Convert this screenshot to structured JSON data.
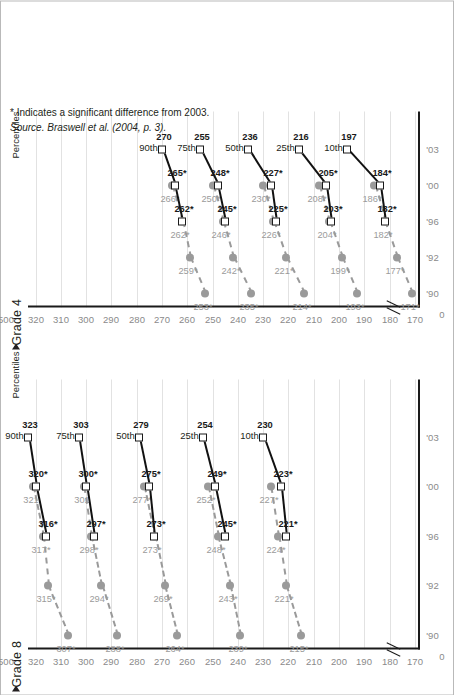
{
  "figure": {
    "percentiles_label": "Percentiles",
    "grade8_title": "Grade 8",
    "grade4_title": "Grade 4",
    "footnote": "* Indicates a significant difference from 2003.",
    "source": "Source. Braswell et al. (2004, p. 3).",
    "legend": [
      {
        "label": "Accommodations not permitted",
        "marker": "gray-circle-dashed"
      },
      {
        "label": "Accommodations permitted",
        "marker": "open-square-solid"
      }
    ],
    "colors": {
      "not_permitted": "#9a9a9a",
      "permitted": "#111111",
      "gridline": "#e2e2e2",
      "axis": "#1a1a1a",
      "tick_text": "#8a8a8a"
    }
  },
  "chart_data": [
    {
      "type": "line",
      "title": "Grade 8",
      "xlabel": "",
      "ylabel": "",
      "x": [
        "'90",
        "'92",
        "'96",
        "'00",
        "'03"
      ],
      "xtick_labels": [
        "'90",
        "'92",
        "'96",
        "'00",
        "'03"
      ],
      "ytick_labels": [
        "500",
        "320",
        "310",
        "300",
        "290",
        "280",
        "270",
        "260",
        "250",
        "240",
        "230",
        "220",
        "210",
        "200",
        "190",
        "180",
        "170",
        "0"
      ],
      "ylim": [
        170,
        325
      ],
      "axis_break": true,
      "grid": true,
      "legend_position": "bottom-right",
      "percentiles": [
        "90th",
        "75th",
        "50th",
        "25th",
        "10th"
      ],
      "series": [
        {
          "name": "Accommodations not permitted",
          "style": "dashed-gray-circle",
          "points": {
            "90th": [
              {
                "x": "'90",
                "y": 307,
                "label": "307*"
              },
              {
                "x": "'92",
                "y": 315,
                "label": "315*"
              },
              {
                "x": "'96",
                "y": 317,
                "label": "317*"
              },
              {
                "x": "'00",
                "y": 321,
                "label": "321"
              }
            ],
            "75th": [
              {
                "x": "'90",
                "y": 288,
                "label": "288*"
              },
              {
                "x": "'92",
                "y": 294,
                "label": "294*"
              },
              {
                "x": "'96",
                "y": 298,
                "label": "298*"
              },
              {
                "x": "'00",
                "y": 301,
                "label": "301"
              }
            ],
            "50th": [
              {
                "x": "'90",
                "y": 264,
                "label": "264*"
              },
              {
                "x": "'92",
                "y": 269,
                "label": "269*"
              },
              {
                "x": "'96",
                "y": 273,
                "label": "273*"
              },
              {
                "x": "'00",
                "y": 277,
                "label": "277*"
              }
            ],
            "25th": [
              {
                "x": "'90",
                "y": 239,
                "label": "239*"
              },
              {
                "x": "'92",
                "y": 243,
                "label": "243*"
              },
              {
                "x": "'96",
                "y": 248,
                "label": "248*"
              },
              {
                "x": "'00",
                "y": 252,
                "label": "252*"
              }
            ],
            "10th": [
              {
                "x": "'90",
                "y": 215,
                "label": "215*"
              },
              {
                "x": "'92",
                "y": 221,
                "label": "221*"
              },
              {
                "x": "'96",
                "y": 224,
                "label": "224*"
              },
              {
                "x": "'00",
                "y": 227,
                "label": "227*"
              }
            ]
          }
        },
        {
          "name": "Accommodations permitted",
          "style": "solid-black-square",
          "points": {
            "90th": [
              {
                "x": "'96",
                "y": 316,
                "label": "316*"
              },
              {
                "x": "'00",
                "y": 320,
                "label": "320*"
              },
              {
                "x": "'03",
                "y": 323,
                "label": "323"
              }
            ],
            "75th": [
              {
                "x": "'96",
                "y": 297,
                "label": "297*"
              },
              {
                "x": "'00",
                "y": 300,
                "label": "300*"
              },
              {
                "x": "'03",
                "y": 303,
                "label": "303"
              }
            ],
            "50th": [
              {
                "x": "'96",
                "y": 273,
                "label": "273*"
              },
              {
                "x": "'00",
                "y": 275,
                "label": "275*"
              },
              {
                "x": "'03",
                "y": 279,
                "label": "279"
              }
            ],
            "25th": [
              {
                "x": "'96",
                "y": 245,
                "label": "245*"
              },
              {
                "x": "'00",
                "y": 249,
                "label": "249*"
              },
              {
                "x": "'03",
                "y": 254,
                "label": "254"
              }
            ],
            "10th": [
              {
                "x": "'96",
                "y": 221,
                "label": "221*"
              },
              {
                "x": "'00",
                "y": 223,
                "label": "223*"
              },
              {
                "x": "'03",
                "y": 230,
                "label": "230"
              }
            ]
          }
        }
      ]
    },
    {
      "type": "line",
      "title": "Grade 4",
      "xlabel": "",
      "ylabel": "",
      "x": [
        "'90",
        "'92",
        "'96",
        "'00",
        "'03"
      ],
      "xtick_labels": [
        "'90",
        "'92",
        "'96",
        "'00",
        "'03"
      ],
      "ytick_labels": [
        "500",
        "320",
        "310",
        "300",
        "290",
        "280",
        "270",
        "260",
        "250",
        "240",
        "230",
        "220",
        "210",
        "200",
        "190",
        "180",
        "170",
        "0"
      ],
      "ylim": [
        170,
        325
      ],
      "axis_break": true,
      "grid": true,
      "legend_position": "bottom-right",
      "percentiles": [
        "90th",
        "75th",
        "50th",
        "25th",
        "10th"
      ],
      "series": [
        {
          "name": "Accommodations not permitted",
          "style": "dashed-gray-circle",
          "points": {
            "90th": [
              {
                "x": "'90",
                "y": 253,
                "label": "253*"
              },
              {
                "x": "'92",
                "y": 259,
                "label": "259*"
              },
              {
                "x": "'96",
                "y": 262,
                "label": "262*"
              },
              {
                "x": "'00",
                "y": 266,
                "label": "266*"
              }
            ],
            "75th": [
              {
                "x": "'90",
                "y": 235,
                "label": "235*"
              },
              {
                "x": "'92",
                "y": 242,
                "label": "242*"
              },
              {
                "x": "'96",
                "y": 246,
                "label": "246*"
              },
              {
                "x": "'00",
                "y": 250,
                "label": "250*"
              }
            ],
            "50th": [
              {
                "x": "'90",
                "y": 214,
                "label": "214*"
              },
              {
                "x": "'92",
                "y": 221,
                "label": "221*"
              },
              {
                "x": "'96",
                "y": 226,
                "label": "226*"
              },
              {
                "x": "'00",
                "y": 230,
                "label": "230*"
              }
            ],
            "25th": [
              {
                "x": "'90",
                "y": 193,
                "label": "193*"
              },
              {
                "x": "'92",
                "y": 199,
                "label": "199*"
              },
              {
                "x": "'96",
                "y": 204,
                "label": "204*"
              },
              {
                "x": "'00",
                "y": 208,
                "label": "208*"
              }
            ],
            "10th": [
              {
                "x": "'90",
                "y": 171,
                "label": "171*"
              },
              {
                "x": "'92",
                "y": 177,
                "label": "177*"
              },
              {
                "x": "'96",
                "y": 182,
                "label": "182*"
              },
              {
                "x": "'00",
                "y": 186,
                "label": "186*"
              }
            ]
          }
        },
        {
          "name": "Accommodations permitted",
          "style": "solid-black-square",
          "points": {
            "90th": [
              {
                "x": "'96",
                "y": 262,
                "label": "262*"
              },
              {
                "x": "'00",
                "y": 265,
                "label": "265*"
              },
              {
                "x": "'03",
                "y": 270,
                "label": "270"
              }
            ],
            "75th": [
              {
                "x": "'96",
                "y": 245,
                "label": "245*"
              },
              {
                "x": "'00",
                "y": 248,
                "label": "248*"
              },
              {
                "x": "'03",
                "y": 255,
                "label": "255"
              }
            ],
            "50th": [
              {
                "x": "'96",
                "y": 225,
                "label": "225*"
              },
              {
                "x": "'00",
                "y": 227,
                "label": "227*"
              },
              {
                "x": "'03",
                "y": 236,
                "label": "236"
              }
            ],
            "25th": [
              {
                "x": "'96",
                "y": 203,
                "label": "203*"
              },
              {
                "x": "'00",
                "y": 205,
                "label": "205*"
              },
              {
                "x": "'03",
                "y": 216,
                "label": "216"
              }
            ],
            "10th": [
              {
                "x": "'96",
                "y": 182,
                "label": "182*"
              },
              {
                "x": "'00",
                "y": 184,
                "label": "184*"
              },
              {
                "x": "'03",
                "y": 197,
                "label": "197"
              }
            ]
          }
        }
      ]
    }
  ]
}
